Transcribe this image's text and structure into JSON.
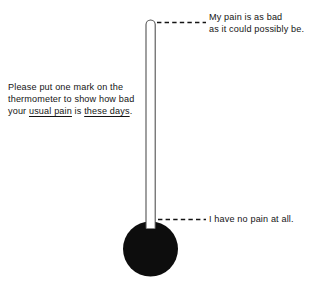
{
  "figure": {
    "name": "pain-thermometer",
    "background_color": "#ffffff",
    "ink_color": "#141414"
  },
  "instruction": {
    "lines": [
      "Please put one mark on the",
      "thermometer to show how bad"
    ],
    "final_line": {
      "part1": "your ",
      "emphasis1": "usual pain",
      "part2": " is ",
      "emphasis2": "these days",
      "part3": "."
    },
    "full_text": "Please put one mark on the thermometer to show how bad your usual pain is these days."
  },
  "anchors": {
    "top": {
      "lines": [
        "My pain is as bad",
        "as it could possibly be."
      ],
      "full_text": "My pain is as bad as it could possibly be."
    },
    "bottom": {
      "lines": [
        "I have no pain at all."
      ],
      "full_text": "I have no pain at all."
    }
  },
  "thermometer": {
    "tube_outline_color": "#141414",
    "tube_fill_color": "#ffffff",
    "bulb_color": "#0d0d0d",
    "leader_line_style": "dashed"
  }
}
